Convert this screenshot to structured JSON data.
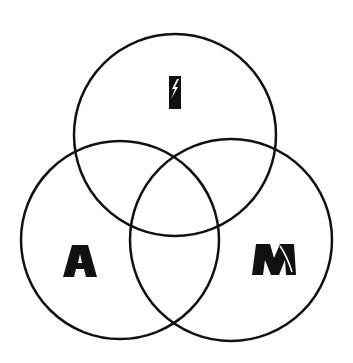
{
  "diagram": {
    "type": "venn",
    "background": "#ffffff",
    "stroke_color": "#111111",
    "fill_color": "#111111",
    "circles": [
      {
        "id": "top",
        "label": "I",
        "cx": 175,
        "cy": 135,
        "r": 101
      },
      {
        "id": "left",
        "label": "A",
        "cx": 120,
        "cy": 240,
        "r": 99
      },
      {
        "id": "right",
        "label": "M",
        "cx": 231,
        "cy": 240,
        "r": 101
      }
    ],
    "labels": {
      "top": "I",
      "left": "A",
      "right": "M"
    },
    "icons": {
      "top": "lightning-bolt-icon",
      "right": "stripe-icon"
    }
  }
}
